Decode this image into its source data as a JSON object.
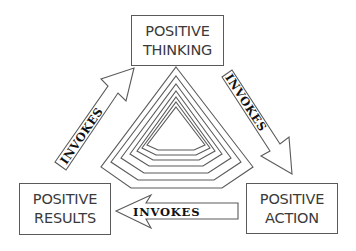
{
  "diagram": {
    "type": "cycle",
    "nodes": [
      {
        "id": "thinking",
        "line1": "POSITIVE",
        "line2": "THINKING"
      },
      {
        "id": "action",
        "line1": "POSITIVE",
        "line2": "ACTION"
      },
      {
        "id": "results",
        "line1": "POSITIVE",
        "line2": "RESULTS"
      }
    ],
    "edges": [
      {
        "from": "thinking",
        "to": "action",
        "label": "INVOKES"
      },
      {
        "from": "action",
        "to": "results",
        "label": "INVOKES"
      },
      {
        "from": "results",
        "to": "thinking",
        "label": "INVOKES"
      }
    ],
    "center_shape": {
      "type": "nested-pentagon",
      "rings": 6
    },
    "colors": {
      "stroke": "#5a5a5a",
      "text": "#3a3a3a",
      "arrow_label": "#111111",
      "background": "#ffffff"
    }
  }
}
